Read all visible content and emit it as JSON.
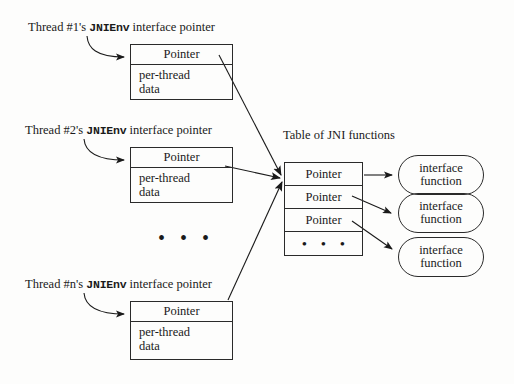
{
  "diagram": {
    "threads": [
      {
        "label_prefix": "Thread #1's ",
        "label_mono": "JNIEnv",
        "label_suffix": " interface pointer",
        "pointer_cell": "Pointer",
        "data_line1": "per-thread",
        "data_line2": "data"
      },
      {
        "label_prefix": "Thread #2's ",
        "label_mono": "JNIEnv",
        "label_suffix": " interface pointer",
        "pointer_cell": "Pointer",
        "data_line1": "per-thread",
        "data_line2": "data"
      },
      {
        "label_prefix": "Thread #n's ",
        "label_mono": "JNIEnv",
        "label_suffix": " interface pointer",
        "pointer_cell": "Pointer",
        "data_line1": "per-thread",
        "data_line2": "data"
      }
    ],
    "threads_ellipsis": "• • •",
    "table": {
      "caption": "Table of JNI functions",
      "rows": [
        "Pointer",
        "Pointer",
        "Pointer"
      ],
      "ellipsis_row": "• • •"
    },
    "functions": [
      {
        "line1": "interface",
        "line2": "function"
      },
      {
        "line1": "interface",
        "line2": "function"
      },
      {
        "line1": "interface",
        "line2": "function"
      }
    ],
    "colors": {
      "stroke": "#2a2a2a",
      "background": "#fdfdfc",
      "text": "#1a1a1a"
    }
  }
}
